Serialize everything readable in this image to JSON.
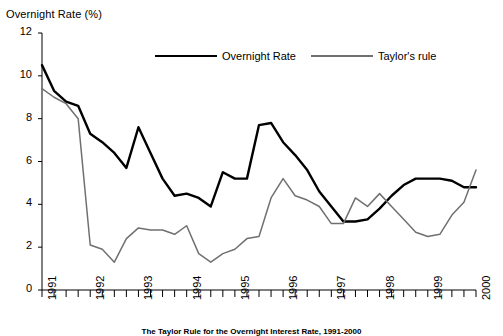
{
  "chart_data": {
    "type": "line",
    "title": "Overnight Rate (%)",
    "xlabel": "",
    "ylabel": "Overnight Rate (%)",
    "ylim": [
      0,
      12
    ],
    "xlim": [
      1991.0,
      2000.0
    ],
    "yticks": [
      0,
      2,
      4,
      6,
      8,
      10,
      12
    ],
    "ytick_labels": [
      "0",
      "2",
      "4",
      "6",
      "8",
      "10",
      "12"
    ],
    "xticks": [
      1991,
      1992,
      1993,
      1994,
      1995,
      1996,
      1997,
      1998,
      1999,
      2000
    ],
    "xtick_labels": [
      "1991",
      "1992",
      "1993",
      "1994",
      "1995",
      "1996",
      "1997",
      "1998",
      "1999",
      "2000"
    ],
    "minor_xticks_per_year": 4,
    "grid": false,
    "legend_position": "top-center",
    "x": [
      1991.0,
      1991.25,
      1991.5,
      1991.75,
      1992.0,
      1992.25,
      1992.5,
      1992.75,
      1993.0,
      1993.25,
      1993.5,
      1993.75,
      1994.0,
      1994.25,
      1994.5,
      1994.75,
      1995.0,
      1995.25,
      1995.5,
      1995.75,
      1996.0,
      1996.25,
      1996.5,
      1996.75,
      1997.0,
      1997.25,
      1997.5,
      1997.75,
      1998.0,
      1998.25,
      1998.5,
      1998.75,
      1999.0,
      1999.25,
      1999.5,
      1999.75,
      2000.0
    ],
    "series": [
      {
        "name": "Overnight Rate",
        "color": "#000000",
        "width": 2.4,
        "values": [
          10.5,
          9.3,
          8.8,
          8.6,
          7.3,
          6.9,
          6.4,
          5.7,
          7.6,
          6.4,
          5.2,
          4.4,
          4.5,
          4.3,
          3.9,
          5.5,
          5.2,
          5.2,
          7.7,
          7.8,
          6.9,
          6.3,
          5.6,
          4.6,
          3.9,
          3.2,
          3.2,
          3.3,
          3.8,
          4.4,
          4.9,
          5.2,
          5.2,
          5.2,
          5.1,
          4.8,
          4.8
        ]
      },
      {
        "name": "Taylor's rule",
        "color": "#707070",
        "width": 1.5,
        "values": [
          9.4,
          9.0,
          8.7,
          8.0,
          2.1,
          1.9,
          1.3,
          2.4,
          2.9,
          2.8,
          2.8,
          2.6,
          3.0,
          1.7,
          1.3,
          1.7,
          1.9,
          2.4,
          2.5,
          4.3,
          5.2,
          4.4,
          4.2,
          3.9,
          3.1,
          3.1,
          4.3,
          3.9,
          4.5,
          3.9,
          3.3,
          2.7,
          2.5,
          2.6,
          3.5,
          4.1,
          5.6
        ]
      }
    ],
    "legend": [
      {
        "label": "Overnight Rate",
        "color": "#000000"
      },
      {
        "label": "Taylor's rule",
        "color": "#707070"
      }
    ]
  },
  "caption": "The Taylor Rule for the Overnight Interest Rate, 1991-2000"
}
